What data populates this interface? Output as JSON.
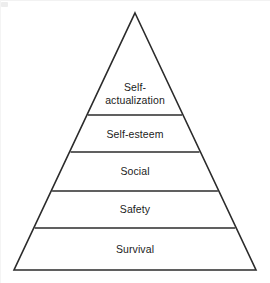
{
  "diagram": {
    "type": "pyramid",
    "line_color": "#2b2b2b",
    "fill_color": "#ffffff",
    "background_color": "#ffffff",
    "apex": {
      "x": 135,
      "y": 13
    },
    "base_left": {
      "x": 14,
      "y": 270
    },
    "base_right": {
      "x": 256,
      "y": 270
    },
    "divider_y_values": [
      115,
      152,
      191,
      228
    ],
    "tiers": [
      {
        "label": "Self-\nactualization",
        "label_line_1": "Self-",
        "label_line_2": "actualization",
        "rank": 5,
        "center_x": 135,
        "center_y": 93,
        "top_y": 13,
        "bottom_y": 115
      },
      {
        "label": "Self-esteem",
        "rank": 4,
        "center_x": 135,
        "center_y": 134,
        "top_y": 115,
        "bottom_y": 152
      },
      {
        "label": "Social",
        "rank": 3,
        "center_x": 135,
        "center_y": 171,
        "top_y": 152,
        "bottom_y": 191
      },
      {
        "label": "Safety",
        "rank": 2,
        "center_x": 135,
        "center_y": 209,
        "top_y": 191,
        "bottom_y": 228
      },
      {
        "label": "Survival",
        "rank": 1,
        "center_x": 135,
        "center_y": 249,
        "top_y": 228,
        "bottom_y": 270
      }
    ]
  }
}
